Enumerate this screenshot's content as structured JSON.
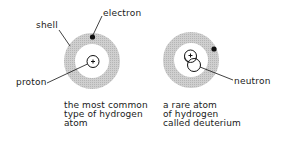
{
  "diagram": {
    "labels": {
      "shell": "shell",
      "electron": "electron",
      "proton": "proton",
      "neutron": "neutron"
    },
    "atoms": [
      {
        "name": "hydrogen",
        "caption": [
          "the most common",
          "type of hydrogen",
          "atom"
        ],
        "nucleus_symbol": "+",
        "particles": [
          "proton",
          "electron"
        ]
      },
      {
        "name": "deuterium",
        "caption": [
          "a rare atom",
          "of hydrogen",
          "called deuterium"
        ],
        "nucleus_symbol": "+",
        "particles": [
          "proton",
          "neutron",
          "electron"
        ]
      }
    ],
    "colors": {
      "shell": "#c8c8c8",
      "ink": "#1a1a1a",
      "background": "#ffffff"
    }
  }
}
